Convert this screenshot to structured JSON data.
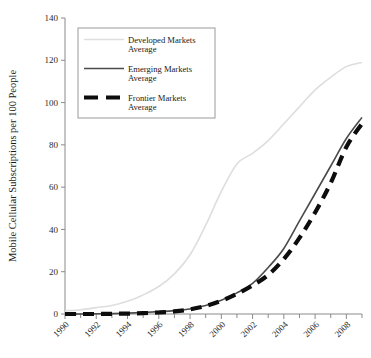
{
  "chart_data": {
    "type": "line",
    "title": "",
    "xlabel": "",
    "ylabel": "Mobile Cellular Subscriptions per 100 People",
    "xlim": [
      1990,
      2009
    ],
    "ylim": [
      0,
      140
    ],
    "yticks": [
      0,
      20,
      40,
      60,
      80,
      100,
      120,
      140
    ],
    "xticks_major": [
      1990,
      1992,
      1994,
      1996,
      1998,
      2000,
      2002,
      2004,
      2006,
      2008
    ],
    "xticks_minor": [
      1991,
      1993,
      1995,
      1997,
      1999,
      2001,
      2003,
      2005,
      2007,
      2009
    ],
    "xtick_labels": [
      "1990",
      "1992",
      "1994",
      "1996",
      "1998",
      "2000",
      "2002",
      "2004",
      "2006",
      "2008"
    ],
    "ytick_labels": [
      "0",
      "20",
      "40",
      "60",
      "80",
      "100",
      "120",
      "140"
    ],
    "grid": false,
    "legend_position": "top-left",
    "x": [
      1990,
      1991,
      1992,
      1993,
      1994,
      1995,
      1996,
      1997,
      1998,
      1999,
      2000,
      2001,
      2002,
      2003,
      2004,
      2005,
      2006,
      2007,
      2008,
      2009
    ],
    "series": [
      {
        "name": "Developed Markets Average",
        "label_line1": "Developed Markets",
        "label_line2": "Average",
        "color": "#dedede",
        "style": "solid",
        "width": 1.6,
        "values": [
          1.5,
          2,
          3,
          4,
          6,
          9,
          13,
          19,
          28,
          42,
          58,
          71,
          76,
          82,
          90,
          98,
          106,
          112,
          117,
          119
        ]
      },
      {
        "name": "Emerging Markets Average",
        "label_line1": "Emerging Markets",
        "label_line2": "Average",
        "color": "#4a4a4a",
        "style": "solid",
        "width": 1.6,
        "values": [
          0,
          0,
          0.1,
          0.2,
          0.4,
          0.7,
          1.1,
          1.6,
          2.4,
          4,
          6.5,
          10,
          14.5,
          22,
          31,
          44,
          57,
          70,
          83,
          93
        ]
      },
      {
        "name": "Frontier Markets Average",
        "label_line1": "Frontier Markets",
        "label_line2": "Average",
        "color": "#0d0d0d",
        "style": "dashed",
        "width": 4.2,
        "values": [
          0,
          0,
          0,
          0.1,
          0.2,
          0.4,
          0.7,
          1.2,
          2.2,
          3.8,
          6.2,
          9.5,
          13.5,
          18.5,
          26,
          36,
          48,
          62,
          79,
          90
        ]
      }
    ]
  },
  "legend": {
    "entries": [
      {
        "label_line1": "Developed Markets",
        "label_line2": "Average"
      },
      {
        "label_line1": "Emerging Markets",
        "label_line2": "Average"
      },
      {
        "label_line1": "Frontier Markets",
        "label_line2": "Average"
      }
    ]
  },
  "axis": {
    "y_title": "Mobile Cellular Subscriptions per 100 People"
  }
}
